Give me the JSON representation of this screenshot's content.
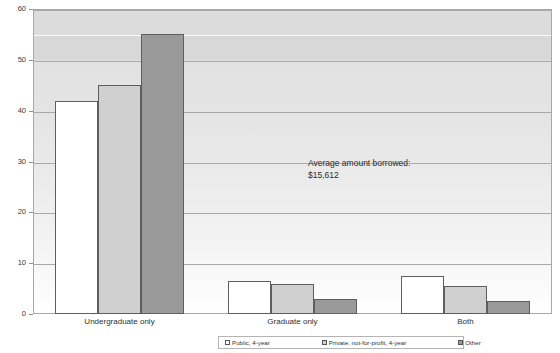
{
  "chart_data": {
    "type": "bar",
    "title": "",
    "subtitle": "",
    "xlabel": "",
    "ylabel": "",
    "ylim": [
      0,
      60
    ],
    "yticks": [
      0,
      10,
      20,
      30,
      40,
      50,
      60
    ],
    "ytick_labels": [
      "0",
      "10",
      "20",
      "30",
      "40",
      "50",
      "60"
    ],
    "grid": true,
    "legend_position": "bottom",
    "categories": [
      "Undergraduate only",
      "Graduate only",
      "Both"
    ],
    "series": [
      {
        "name": "Public, 4-year",
        "color": "#ffffff",
        "values": [
          42,
          6.5,
          7.5
        ]
      },
      {
        "name": "Private, not-for-profit, 4-year",
        "color": "#d0d0d0",
        "values": [
          45,
          6,
          5.5
        ]
      },
      {
        "name": "Other",
        "color": "#9a9a9a",
        "values": [
          55,
          3,
          2.5
        ]
      }
    ],
    "annotations": [
      {
        "text": "Average amount borrowed:\n$15,612",
        "x": 308,
        "y": 158
      }
    ]
  },
  "legend": {
    "items": [
      {
        "label": "Public, 4-year"
      },
      {
        "label": "Private, not-for-profit, 4-year"
      },
      {
        "label": "Other"
      }
    ]
  },
  "annotation": {
    "text": "Average amount borrowed:\n$15,612"
  },
  "colors": {
    "series_public": "#ffffff",
    "series_private": "#d0d0d0",
    "series_other": "#9a9a9a",
    "gridline": "#a9a9a9",
    "frame": "#a8a8a8"
  }
}
